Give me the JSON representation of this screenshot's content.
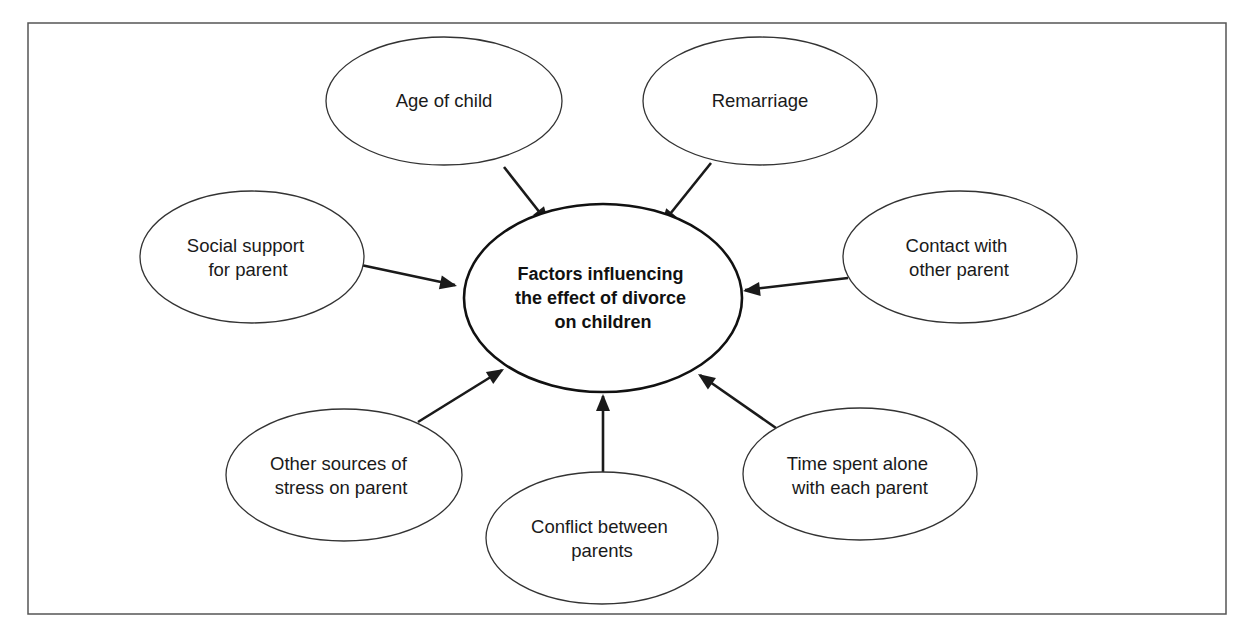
{
  "diagram": {
    "type": "concept-map",
    "colors": {
      "stroke": "#1a1a1a",
      "frame": "#555555",
      "background": "#ffffff",
      "text": "#1a1a1a"
    },
    "center": {
      "lines": [
        "Factors influencing",
        "the effect of divorce",
        "on children"
      ]
    },
    "factors": [
      {
        "id": "age",
        "lines": [
          "Age of child"
        ]
      },
      {
        "id": "remarriage",
        "lines": [
          "Remarriage"
        ]
      },
      {
        "id": "social",
        "lines": [
          "Social support",
          "for parent"
        ]
      },
      {
        "id": "contact",
        "lines": [
          "Contact with",
          "other parent"
        ]
      },
      {
        "id": "stress",
        "lines": [
          "Other sources of",
          "stress on parent"
        ]
      },
      {
        "id": "conflict",
        "lines": [
          "Conflict between",
          "parents"
        ]
      },
      {
        "id": "time",
        "lines": [
          "Time spent alone",
          "with each parent"
        ]
      }
    ]
  }
}
